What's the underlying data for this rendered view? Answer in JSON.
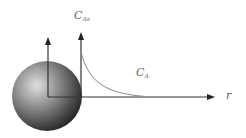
{
  "diagram": {
    "labels": {
      "surface_concentration": {
        "main": "C",
        "sub": "As"
      },
      "bulk_concentration": {
        "main": "C",
        "sub": "A"
      },
      "radial_axis": "r"
    },
    "colors": {
      "axis": "#333333",
      "curve": "#888888",
      "sphere_light": "#d8d8d8",
      "sphere_dark": "#1a1a1a",
      "label": "#666666"
    }
  }
}
